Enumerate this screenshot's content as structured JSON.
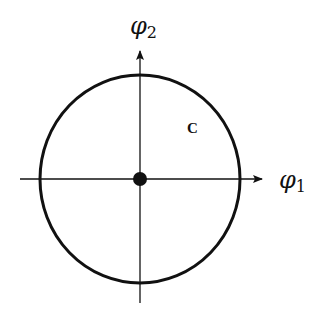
{
  "diagram": {
    "type": "phase-space circle",
    "axes": {
      "x": {
        "symbol": "φ",
        "subscript": "1"
      },
      "y": {
        "symbol": "φ",
        "subscript": "2"
      }
    },
    "curve_label": "C",
    "colors": {
      "stroke": "#111111",
      "background": "#ffffff"
    }
  }
}
